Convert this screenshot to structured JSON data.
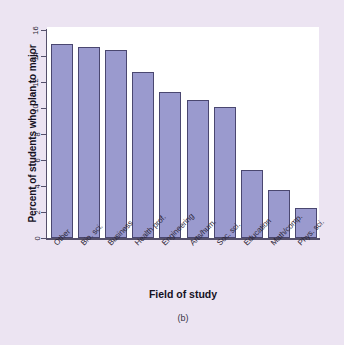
{
  "chart_data": {
    "type": "bar",
    "title": "",
    "xlabel": "Field of study",
    "ylabel": "Percent of students who plan to major",
    "categories": [
      "Other",
      "Bio. sci.",
      "Business",
      "Health prof.",
      "Engineering",
      "Arts/hum.",
      "Soc. sci.",
      "Education",
      "Math/comp.",
      "Phys. sci."
    ],
    "values": [
      14.9,
      14.7,
      14.5,
      12.8,
      11.2,
      10.6,
      10.1,
      5.2,
      3.7,
      2.3
    ],
    "ylim": [
      0,
      16
    ],
    "yticks": [
      "0",
      "2",
      "4",
      "6",
      "8",
      "10",
      "12",
      "14",
      "16"
    ],
    "ytick_values": [
      0,
      2,
      4,
      6,
      8,
      10,
      12,
      14,
      16
    ],
    "grid": false,
    "legend": false,
    "bar_color": "#9a9ace",
    "bar_border_color": "#4a4770",
    "panel_color": "#ffffff",
    "background_color": "#ece4f2"
  },
  "figure": {
    "caption": "(b)"
  }
}
